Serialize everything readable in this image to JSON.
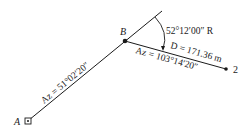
{
  "diagram": {
    "points": {
      "A": {
        "label": "A",
        "x": 28,
        "y": 121
      },
      "B": {
        "label": "B",
        "x": 125,
        "y": 41
      },
      "P2": {
        "label": "2",
        "x": 226,
        "y": 69
      }
    },
    "line_AB": {
      "azimuth_text": "Az = 51°02′20″"
    },
    "line_B2": {
      "azimuth_text": "Az = 103°14′20″",
      "distance_text": "D = 171.36 m"
    },
    "deflection_angle": {
      "text": "52°12′00″ R"
    },
    "colors": {
      "line": "#1a1a1a",
      "background": "#ffffff"
    }
  }
}
